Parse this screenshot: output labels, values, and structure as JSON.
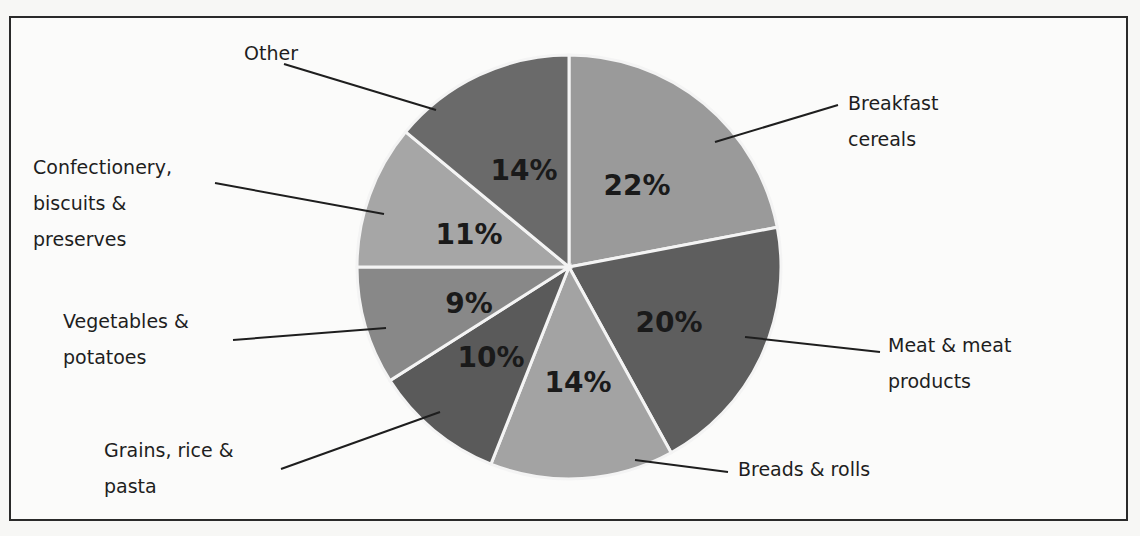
{
  "chart_data": {
    "type": "pie",
    "title": "",
    "start_angle_deg": 0,
    "direction": "clockwise",
    "slices": [
      {
        "label": "Breakfast cereals",
        "lines": [
          "Breakfast",
          "cereals"
        ],
        "value": 22,
        "display": "22%",
        "color": "#9a9a9a"
      },
      {
        "label": "Meat & meat products",
        "lines": [
          "Meat & meat",
          "products"
        ],
        "value": 20,
        "display": "20%",
        "color": "#5e5e5e"
      },
      {
        "label": "Breads & rolls",
        "lines": [
          "Breads & rolls"
        ],
        "value": 14,
        "display": "14%",
        "color": "#a3a3a3"
      },
      {
        "label": "Grains, rice & pasta",
        "lines": [
          "Grains, rice &",
          "pasta"
        ],
        "value": 10,
        "display": "10%",
        "color": "#5a5a5a"
      },
      {
        "label": "Vegetables & potatoes",
        "lines": [
          "Vegetables &",
          "potatoes"
        ],
        "value": 9,
        "display": "9%",
        "color": "#888888"
      },
      {
        "label": "Confectionery, biscuits & preserves",
        "lines": [
          "Confectionery,",
          "biscuits &",
          "preserves"
        ],
        "value": 11,
        "display": "11%",
        "color": "#a6a6a6"
      },
      {
        "label": "Other",
        "lines": [
          "Other"
        ],
        "value": 14,
        "display": "14%",
        "color": "#6a6a6a"
      }
    ],
    "legend": "none",
    "data_labels": "percent inside slices, category labels outside with leader lines"
  }
}
